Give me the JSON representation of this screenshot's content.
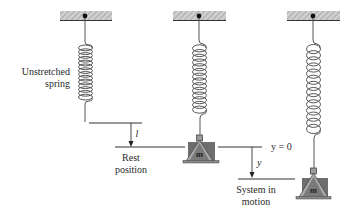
{
  "diagram": {
    "type": "mass-spring system",
    "panels": [
      {
        "id": "unstretched",
        "label_lines": [
          "Unstretched",
          "spring"
        ]
      },
      {
        "id": "rest",
        "label_lines": [
          "Rest",
          "position"
        ],
        "displacement_label": "l",
        "mass_label": "m"
      },
      {
        "id": "motion",
        "label_lines": [
          "System in",
          "motion"
        ],
        "reference_label": "y = 0",
        "displacement_label": "y",
        "mass_label": "m"
      }
    ],
    "colors": {
      "line": "#3a3a3a",
      "ceiling_fill": "#bdbdbd",
      "mass_body": "#6e6e6e",
      "mass_hanger": "#a8a8a8",
      "mass_base": "#8a8a8a"
    }
  }
}
